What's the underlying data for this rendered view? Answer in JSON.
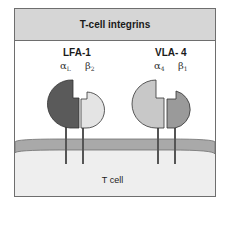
{
  "title": "T-cell integrins",
  "integrins": [
    {
      "name": "LFA-1",
      "alpha": {
        "symbol": "α",
        "subscript": "L",
        "color": "#5a5a5a"
      },
      "beta": {
        "symbol": "β",
        "subscript": "2",
        "color": "#e4e4e4"
      }
    },
    {
      "name": "VLA- 4",
      "alpha": {
        "symbol": "α",
        "subscript": "4",
        "color": "#c8c8c8"
      },
      "beta": {
        "symbol": "β",
        "subscript": "1",
        "color": "#9a9a9a"
      }
    }
  ],
  "cell": {
    "label": "T cell",
    "membrane_color": "#a9a9a9",
    "cytoplasm_color": "#eeeeee"
  },
  "colors": {
    "header_bg": "#d6d6d6",
    "border": "#6e6e6e"
  }
}
